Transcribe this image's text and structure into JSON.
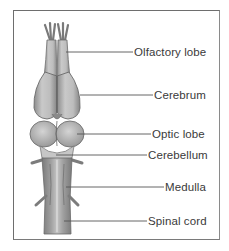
{
  "diagram": {
    "type": "anatomical-labeled-illustration",
    "colors": {
      "frame": "#6e6e6e",
      "tissue_light": "#c8c8c8",
      "tissue_mid": "#a6a6a6",
      "tissue_dark": "#7c7c7c",
      "leader_line": "#555555",
      "text": "#3a3a3a"
    },
    "labels": [
      {
        "id": "olfactory-lobe",
        "text": "Olfactory lobe"
      },
      {
        "id": "cerebrum",
        "text": "Cerebrum"
      },
      {
        "id": "optic-lobe",
        "text": "Optic lobe"
      },
      {
        "id": "cerebellum",
        "text": "Cerebellum"
      },
      {
        "id": "medulla",
        "text": "Medulla"
      },
      {
        "id": "spinal-cord",
        "text": "Spinal cord"
      }
    ]
  }
}
